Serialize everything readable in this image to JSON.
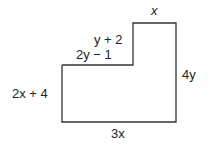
{
  "figure": {
    "type": "L-shaped polygon (rectilinear)",
    "labels": {
      "top": "x",
      "step_vertical": "y + 2",
      "step_horizontal": "2y − 1",
      "left": "2x + 4",
      "right": "4y",
      "bottom": "3x"
    },
    "colors": {
      "stroke": "#333333",
      "text": "#222222",
      "background": "#ffffff"
    }
  }
}
